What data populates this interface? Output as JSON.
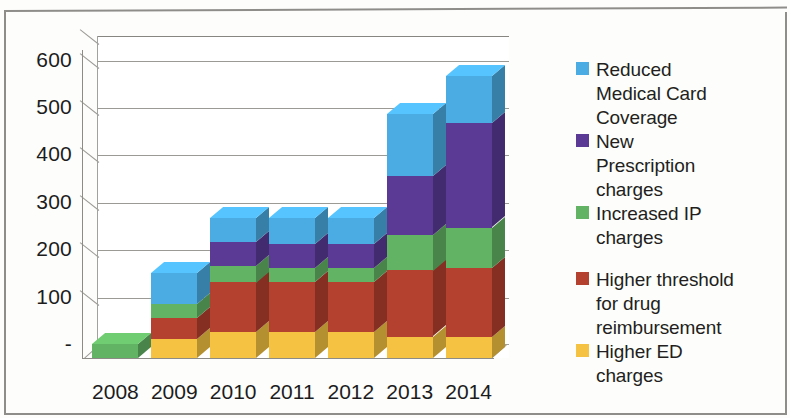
{
  "chart_data": {
    "type": "bar",
    "subtype": "stacked-column-3d",
    "title": "",
    "xlabel": "",
    "ylabel": "",
    "categories": [
      "2008",
      "2009",
      "2010",
      "2011",
      "2012",
      "2013",
      "2014"
    ],
    "ylim": [
      0,
      650
    ],
    "yticks": [
      0,
      100,
      200,
      300,
      400,
      500,
      600
    ],
    "ytick_labels": [
      "-",
      "100",
      "200",
      "300",
      "400",
      "500",
      "600"
    ],
    "grid": true,
    "legend_position": "right",
    "series": [
      {
        "name": "Higher ED charges",
        "color": "#f5c242",
        "values": [
          0,
          40,
          55,
          55,
          55,
          45,
          45
        ]
      },
      {
        "name": "Higher threshold for drug reimbursement",
        "color": "#b4402f",
        "values": [
          0,
          45,
          105,
          105,
          105,
          140,
          145
        ]
      },
      {
        "name": "Increased IP charges",
        "color": "#62b464",
        "values": [
          30,
          30,
          35,
          30,
          30,
          75,
          85
        ]
      },
      {
        "name": "New Prescription charges",
        "color": "#5b3a96",
        "values": [
          0,
          0,
          50,
          50,
          50,
          125,
          220
        ]
      },
      {
        "name": "Reduced Medical Card Coverage",
        "color": "#4bace3",
        "values": [
          0,
          65,
          50,
          55,
          55,
          130,
          100
        ]
      }
    ],
    "totals": [
      30,
      180,
      295,
      295,
      295,
      515,
      595
    ]
  },
  "legend": {
    "items": [
      {
        "label": "Reduced\nMedical Card\nCoverage",
        "color": "#4bace3",
        "name": "reduced-medical-card-coverage"
      },
      {
        "label": "New\nPrescription\ncharges",
        "color": "#5b3a96",
        "name": "new-prescription-charges"
      },
      {
        "label": "Increased IP\ncharges",
        "color": "#62b464",
        "name": "increased-ip-charges"
      },
      {
        "label": "Higher threshold\nfor drug\nreimbursement",
        "color": "#b4402f",
        "name": "higher-threshold-for-drug-reimbursement"
      },
      {
        "label": "Higher ED\ncharges",
        "color": "#f5c242",
        "name": "higher-ed-charges"
      }
    ]
  }
}
